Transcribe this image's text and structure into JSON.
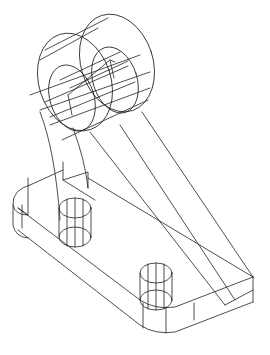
{
  "drawing": {
    "type": "isometric-wireframe",
    "subject": "bracket with cylindrical boss and base plate with two holes",
    "stroke_color": "#222222",
    "background": "#ffffff",
    "width": 270,
    "height": 355
  },
  "geometry": {
    "ellipses": [
      {
        "name": "boss-front-outer",
        "cx": 75,
        "cy": 82,
        "rx": 36,
        "ry": 50,
        "rot": -18
      },
      {
        "name": "boss-front-inner",
        "cx": 72,
        "cy": 98,
        "rx": 22,
        "ry": 34,
        "rot": -18
      },
      {
        "name": "boss-back-outer",
        "cx": 117,
        "cy": 63,
        "rx": 36,
        "ry": 50,
        "rot": -18
      },
      {
        "name": "boss-back-inner",
        "cx": 115,
        "cy": 80,
        "rx": 22,
        "ry": 34,
        "rot": -18
      },
      {
        "name": "hole1-top",
        "cx": 75,
        "cy": 208,
        "rx": 16,
        "ry": 10,
        "rot": 0
      },
      {
        "name": "hole1-bottom",
        "cx": 75,
        "cy": 237,
        "rx": 16,
        "ry": 10,
        "rot": 0
      },
      {
        "name": "hole2-top",
        "cx": 156,
        "cy": 273,
        "rx": 16,
        "ry": 10,
        "rot": 0
      },
      {
        "name": "hole2-bottom",
        "cx": 156,
        "cy": 300,
        "rx": 16,
        "ry": 10,
        "rot": 0
      }
    ],
    "paths": [
      {
        "name": "boss-tangent-top",
        "d": "M40,60 L98,28 M45,50 L108,18"
      },
      {
        "name": "boss-lines",
        "d": "M30,95 L140,55 M40,110 L150,72 M50,125 L150,88 M62,140 L148,100 M45,102 L128,66 M50,117 L135,82 M60,80 L120,52 M70,88 L128,61"
      },
      {
        "name": "boss-slot",
        "d": "M68,95 L110,60 L115,62 M68,95 L72,115 M110,60 L114,78"
      },
      {
        "name": "arm-left-outer",
        "d": "M40,112 Q55,150 60,220"
      },
      {
        "name": "arm-left-inner",
        "d": "M73,128 Q85,160 88,188"
      },
      {
        "name": "arm-diag-1",
        "d": "M120,125 L235,300"
      },
      {
        "name": "arm-diag-2",
        "d": "M142,112 L253,277"
      },
      {
        "name": "arm-diag-3",
        "d": "M90,132 L225,305"
      },
      {
        "name": "arm-base-joint",
        "d": "M63,162 L63,180 L88,172 L88,188 M63,180 L95,200"
      },
      {
        "name": "base-top-back",
        "d": "M30,185 L63,170 M88,178 L253,277"
      },
      {
        "name": "base-top-front",
        "d": "M18,208 L140,300 Q155,310 175,307 L253,277"
      },
      {
        "name": "base-left-end",
        "d": "M30,185 Q12,190 13,205 Q15,215 28,215 L18,208"
      },
      {
        "name": "base-bottom-front",
        "d": "M18,230 L140,325 Q155,335 175,332 L253,302"
      },
      {
        "name": "base-left-bottom",
        "d": "M13,205 L13,225 Q15,237 28,238"
      },
      {
        "name": "base-verticals",
        "d": "M22,205 L22,228 M28,178 L28,215 M143,303 L143,328 M166,307 L166,333 M194,303 L194,320 M253,277 L253,302"
      },
      {
        "name": "base-right-top",
        "d": "M225,305 L253,290"
      },
      {
        "name": "hole1-verticals",
        "d": "M59,208 L59,237 M91,208 L91,237 M67,199 L67,246 M75,198 L75,247 M83,199 L83,246"
      },
      {
        "name": "hole2-verticals",
        "d": "M140,273 L140,300 M172,273 L172,300 M148,264 L148,309 M156,263 L156,310 M164,264 L164,309"
      }
    ]
  }
}
